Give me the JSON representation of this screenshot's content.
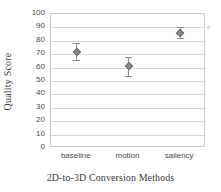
{
  "chart_data": {
    "type": "scatter",
    "title": "",
    "xlabel": "2D-to-3D Conversion Methods",
    "ylabel": "Quality Score",
    "categories": [
      "baseline",
      "motion",
      "saliency"
    ],
    "values": [
      71.5,
      61.0,
      85.5
    ],
    "error_low": [
      66.0,
      54.0,
      82.0
    ],
    "error_high": [
      78.0,
      68.0,
      90.0
    ],
    "ylim": [
      0,
      100
    ],
    "ytick_labels": [
      "0",
      "10",
      "20",
      "30",
      "40",
      "50",
      "60",
      "70",
      "80",
      "90",
      "100"
    ],
    "ytick_values": [
      0,
      10,
      20,
      30,
      40,
      50,
      60,
      70,
      80,
      90,
      100
    ],
    "grid": true,
    "grid_axis": "y",
    "legend": "none",
    "marker_color": "#8a8a8a",
    "errorbar_color": "#8d8d8d",
    "gridline_color": "#d6d6d6",
    "border_color": "#c9c9c9",
    "background_color": "#ffffff"
  }
}
